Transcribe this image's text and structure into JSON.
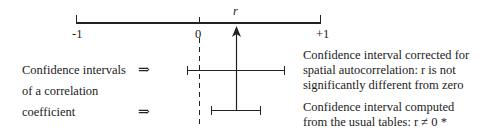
{
  "axis": {
    "min_label": "-1",
    "zero_label": "0",
    "max_label": "+1",
    "estimate_label": "r"
  },
  "left_caption": {
    "line1": "Confidence intervals",
    "line2": "of a correlation",
    "line3": "coefficient",
    "arrow1": "⇒",
    "arrow2": "⇒"
  },
  "upper_interval": {
    "line1": "Confidence interval corrected for",
    "line2": "spatial autocorrelation: r is not",
    "line3": "significantly different from zero"
  },
  "lower_interval": {
    "line1": "Confidence interval computed",
    "line2": "from the usual tables: r ≠ 0 *"
  },
  "colors": {
    "line": "#222222",
    "background": "#ffffff"
  }
}
